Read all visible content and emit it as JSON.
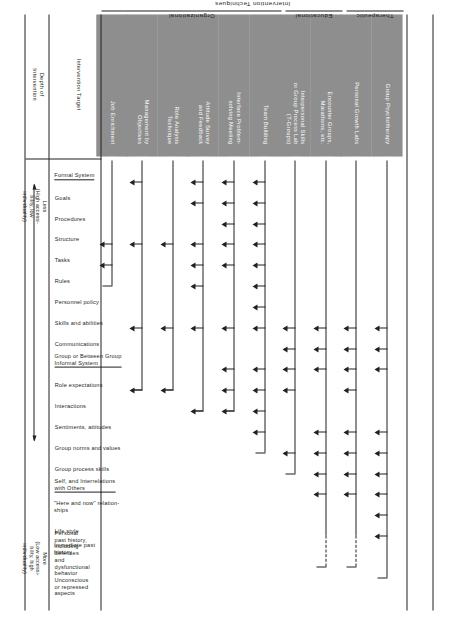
{
  "figure": {
    "caption": "FIGURE 16-1"
  },
  "columns_header": {
    "title": "Intervention Techniques",
    "groups": [
      {
        "label": "Organizational"
      },
      {
        "label": "Educational"
      },
      {
        "label": "Therapeutic"
      }
    ]
  },
  "stub_labels": {
    "intervention_target": "Intervention Target",
    "depth_of_intervention": "Depth of\nIntervention"
  },
  "depth_scale": {
    "low_label": "Less\n(High accessi-\nbility, low\nindividuality)",
    "high_label": "More\n(Low accessi-\nbility, high\nindividuality)",
    "arrow": "double-headed-arrow"
  },
  "chart_data": {
    "type": "table",
    "xlabel": "Intervention Target",
    "ylabel": "Intervention Techniques",
    "grid": false,
    "legend": "none",
    "target_groups": [
      {
        "heading": "Formal System",
        "items": [
          "Goals",
          "Procedures",
          "Structure",
          "Tasks",
          "Rules",
          "Personnel policy",
          "Skills and abilities",
          "Communications"
        ]
      },
      {
        "heading": "Group or Between Group\nInformal System",
        "items": [
          "Role expectations",
          "Interactions",
          "Sentiments, attitudes",
          "Group norms and values",
          "Group process skills"
        ]
      },
      {
        "heading": "Self, and Interrelations\nwith Others",
        "items": [
          "\"Here and now\" relation-\nships",
          "Life style",
          "Immediate past history",
          "Personal past history,\nincluding defenses and\ndysfunctional behavior",
          "Unconscious or repressed\naspects"
        ]
      }
    ],
    "techniques": [
      {
        "label": "Group Psychotherapy",
        "group": "Therapeutic",
        "span_end": 20,
        "targets": [
          8,
          9,
          10,
          13,
          14,
          15,
          16,
          17,
          18
        ],
        "dashed_tail": false
      },
      {
        "label": "Personal Growth Labs",
        "group": "Therapeutic",
        "span_end": 18,
        "targets": [
          8,
          9,
          10,
          11,
          13,
          14,
          15,
          16
        ],
        "dashed_tail": true
      },
      {
        "label": "Encounter Groups,\nMarathons, etc.",
        "group": "Educational",
        "span_end": 18,
        "targets": [
          8,
          9,
          10,
          13,
          14,
          15,
          16
        ],
        "dashed_tail": true
      },
      {
        "label": "Interpersonal Skills\nor Group Process Lab\n(T-Groups)",
        "group": "Educational",
        "span_end": 15,
        "targets": [
          8,
          9,
          10,
          11,
          14
        ],
        "dashed_tail": false
      },
      {
        "label": "Team Building",
        "group": "Organizational",
        "span_end": 14,
        "targets": [
          1,
          2,
          3,
          4,
          5,
          6,
          7,
          8,
          10,
          11,
          12,
          13
        ],
        "dashed_tail": false
      },
      {
        "label": "Interface Problem-\nsolving Meeting",
        "group": "Organizational",
        "span_end": 12,
        "targets": [
          1,
          2,
          3,
          4,
          5,
          8,
          10,
          11,
          12
        ],
        "dashed_tail": false
      },
      {
        "label": "Attitude Survey\nand Feedback",
        "group": "Organizational",
        "span_end": 12,
        "targets": [
          1,
          2,
          4,
          5,
          6,
          8,
          12
        ],
        "dashed_tail": false
      },
      {
        "label": "Role Analysis\nTechnique",
        "group": "Organizational",
        "span_end": 11,
        "targets": [
          4,
          8,
          11
        ],
        "dashed_tail": false
      },
      {
        "label": "Management by\nObjectives",
        "group": "Organizational",
        "span_end": 11,
        "targets": [
          1,
          4,
          8,
          11
        ],
        "dashed_tail": false
      },
      {
        "label": "Job Enrichment",
        "group": "Organizational",
        "span_end": 6,
        "targets": [
          4,
          5
        ],
        "dashed_tail": false
      }
    ],
    "target_axis_count": 21
  }
}
